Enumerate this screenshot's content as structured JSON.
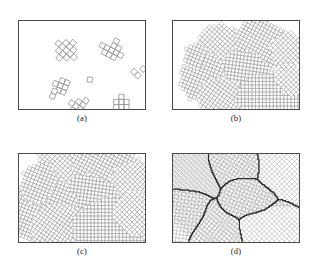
{
  "figure": {
    "type": "scientific-figure",
    "layout": "2x2 grid of bordered panels with lettered captions beneath each panel",
    "background_color": "#ffffff",
    "frame_color": "#4a4a4a",
    "cell_line_color": "#9a9aa0",
    "boundary_color": "#1d1d1d"
  },
  "panels": [
    {
      "id": "a",
      "caption": "(a)",
      "stage": "initial nuclei",
      "description": "Nine isolated small clusters of square cells (plus/cross shaped polyominoes) scattered on an empty white domain, each cluster rotated at its own orientation.",
      "x": 18,
      "y": 20,
      "w": 128,
      "h": 90,
      "nuclei_count": 9,
      "cell_size": 5.2,
      "nuclei": [
        {
          "cx": 48,
          "cy": 30,
          "angle": 42,
          "cells": [
            [
              0,
              0
            ],
            [
              1,
              0
            ],
            [
              -1,
              0
            ],
            [
              0,
              1
            ],
            [
              0,
              -1
            ],
            [
              1,
              1
            ],
            [
              -1,
              -1
            ],
            [
              1,
              -1
            ],
            [
              -1,
              1
            ],
            [
              2,
              0
            ],
            [
              0,
              2
            ],
            [
              -2,
              0
            ],
            [
              0,
              -2
            ]
          ]
        },
        {
          "cx": 94,
          "cy": 30,
          "angle": 28,
          "cells": [
            [
              0,
              0
            ],
            [
              1,
              0
            ],
            [
              -1,
              0
            ],
            [
              0,
              1
            ],
            [
              0,
              -1
            ],
            [
              1,
              1
            ],
            [
              -1,
              1
            ],
            [
              2,
              0
            ],
            [
              -2,
              0
            ],
            [
              0,
              -2
            ],
            [
              1,
              -1
            ]
          ]
        },
        {
          "cx": 117,
          "cy": 52,
          "angle": 45,
          "cells": [
            [
              0,
              0
            ],
            [
              1,
              0
            ]
          ]
        },
        {
          "cx": 72,
          "cy": 60,
          "angle": 8,
          "cells": [
            [
              0,
              0
            ]
          ]
        },
        {
          "cx": 42,
          "cy": 66,
          "angle": 22,
          "cells": [
            [
              0,
              0
            ],
            [
              1,
              0
            ],
            [
              0,
              1
            ],
            [
              0,
              -1
            ],
            [
              -1,
              0
            ],
            [
              1,
              -1
            ],
            [
              1,
              1
            ]
          ]
        },
        {
          "cx": 62,
          "cy": 90,
          "angle": 35,
          "cells": [
            [
              0,
              0
            ],
            [
              1,
              0
            ],
            [
              -1,
              0
            ],
            [
              0,
              1
            ],
            [
              0,
              -1
            ],
            [
              2,
              0
            ],
            [
              -2,
              0
            ],
            [
              0,
              -2
            ],
            [
              1,
              1
            ],
            [
              -1,
              1
            ],
            [
              -1,
              -1
            ]
          ]
        },
        {
          "cx": 104,
          "cy": 88,
          "angle": 0,
          "cells": [
            [
              0,
              0
            ],
            [
              1,
              0
            ],
            [
              -1,
              0
            ],
            [
              0,
              1
            ],
            [
              0,
              -1
            ],
            [
              0,
              2
            ],
            [
              0,
              -2
            ],
            [
              1,
              -1
            ],
            [
              -1,
              -1
            ]
          ]
        },
        {
          "cx": 126,
          "cy": 49,
          "angle": 45,
          "cells": [
            [
              0,
              0
            ]
          ]
        },
        {
          "cx": 36,
          "cy": 72,
          "angle": 22,
          "cells": [
            [
              0,
              0
            ],
            [
              0,
              1
            ]
          ]
        }
      ]
    },
    {
      "id": "b",
      "caption": "(b)",
      "stage": "early growth",
      "description": "Each nucleus has grown into a ragged rotated block of square cells; blocks remain separated by untransformed white regions.",
      "x": 172,
      "y": 20,
      "w": 128,
      "h": 90,
      "grain_count": 9,
      "cell_size": 3.6,
      "grains": [
        {
          "cx": 48,
          "cy": 26,
          "angle": 42,
          "rx": 7,
          "ry": 6,
          "shape": "ragged-rhombus"
        },
        {
          "cx": 90,
          "cy": 24,
          "angle": 28,
          "rx": 8,
          "ry": 7,
          "shape": "ragged-rhombus"
        },
        {
          "cx": 117,
          "cy": 30,
          "angle": 45,
          "rx": 5,
          "ry": 5,
          "shape": "ragged-rhombus"
        },
        {
          "cx": 72,
          "cy": 52,
          "angle": 8,
          "rx": 7,
          "ry": 6,
          "shape": "ragged-rhombus"
        },
        {
          "cx": 30,
          "cy": 58,
          "angle": 22,
          "rx": 6,
          "ry": 7,
          "shape": "ragged-rhombus"
        },
        {
          "cx": 50,
          "cy": 80,
          "angle": 35,
          "rx": 7,
          "ry": 6,
          "shape": "ragged-rhombus"
        },
        {
          "cx": 100,
          "cy": 78,
          "angle": 0,
          "rx": 10,
          "ry": 7,
          "shape": "ragged-rect"
        },
        {
          "cx": 120,
          "cy": 60,
          "angle": 45,
          "rx": 5,
          "ry": 4,
          "shape": "ragged-rhombus"
        },
        {
          "cx": 22,
          "cy": 36,
          "angle": 22,
          "rx": 3,
          "ry": 4,
          "shape": "ragged-rhombus"
        }
      ]
    },
    {
      "id": "c",
      "caption": "(c)",
      "stage": "late growth",
      "description": "Blocks have expanded further and nearly fill the domain; only thin white channels remain between neighbouring grains.",
      "x": 18,
      "y": 153,
      "w": 128,
      "h": 90,
      "grain_count": 9,
      "cell_size": 3.6,
      "grains": [
        {
          "cx": 50,
          "cy": 22,
          "angle": 42,
          "rx": 10,
          "ry": 8,
          "shape": "ragged-rhombus"
        },
        {
          "cx": 92,
          "cy": 22,
          "angle": 28,
          "rx": 11,
          "ry": 9,
          "shape": "ragged-rhombus"
        },
        {
          "cx": 118,
          "cy": 36,
          "angle": 45,
          "rx": 8,
          "ry": 8,
          "shape": "ragged-rhombus"
        },
        {
          "cx": 70,
          "cy": 50,
          "angle": 8,
          "rx": 9,
          "ry": 8,
          "shape": "ragged-rhombus"
        },
        {
          "cx": 26,
          "cy": 58,
          "angle": 22,
          "rx": 9,
          "ry": 10,
          "shape": "ragged-rhombus"
        },
        {
          "cx": 46,
          "cy": 82,
          "angle": 35,
          "rx": 10,
          "ry": 8,
          "shape": "ragged-rhombus"
        },
        {
          "cx": 100,
          "cy": 76,
          "angle": 0,
          "rx": 13,
          "ry": 9,
          "shape": "ragged-rect"
        },
        {
          "cx": 120,
          "cy": 62,
          "angle": 45,
          "rx": 7,
          "ry": 6,
          "shape": "ragged-rhombus"
        },
        {
          "cx": 20,
          "cy": 30,
          "angle": 22,
          "rx": 5,
          "ry": 6,
          "shape": "ragged-rhombus"
        }
      ]
    },
    {
      "id": "d",
      "caption": "(d)",
      "stage": "full impingement",
      "description": "The domain is completely filled; grains meet along dark irregular grain boundaries, each grain keeping its own lattice orientation.",
      "x": 172,
      "y": 153,
      "w": 128,
      "h": 90,
      "grain_count": 7,
      "cell_size": 3.6,
      "grains": [
        {
          "label": "G1",
          "angle": 45,
          "region": "top-left"
        },
        {
          "label": "G2",
          "angle": 28,
          "region": "top-centre"
        },
        {
          "label": "G3",
          "angle": 45,
          "region": "top-right"
        },
        {
          "label": "G4",
          "angle": 18,
          "region": "centre"
        },
        {
          "label": "G5",
          "angle": 8,
          "region": "left-lower"
        },
        {
          "label": "G6",
          "angle": 35,
          "region": "centre-lower"
        },
        {
          "label": "G7",
          "angle": 0,
          "region": "bottom-right"
        }
      ],
      "boundaries_visible": true
    }
  ]
}
